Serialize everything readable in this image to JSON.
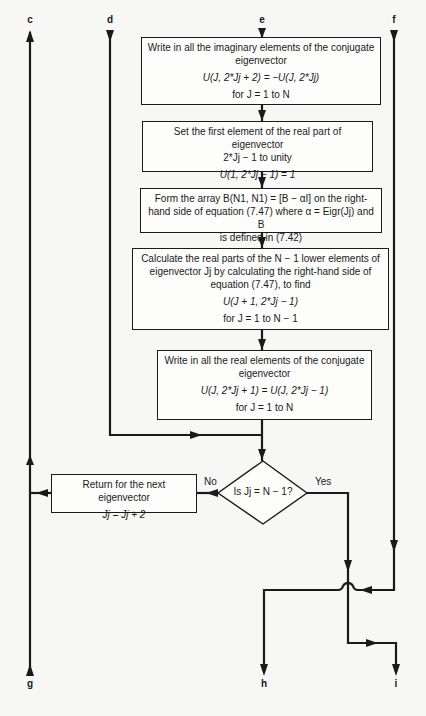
{
  "connectors": {
    "c": "c",
    "d": "d",
    "e": "e",
    "f": "f",
    "g": "g",
    "h": "h",
    "i": "i"
  },
  "boxes": [
    {
      "id": "write-imaginary",
      "lines": [
        "Write in all the imaginary elements of the conjugate",
        "eigenvector"
      ],
      "equation": "U(J, 2*Jj + 2) = −U(J, 2*Jj)",
      "range": "for J = 1 to N"
    },
    {
      "id": "set-first-element",
      "lines": [
        "Set the first element of the real part of eigenvector",
        "2*Jj − 1 to unity"
      ],
      "equation": "U(1, 2*Jj − 1) = 1"
    },
    {
      "id": "form-array",
      "lines": [
        "Form the array B(N1, N1) = [B − αI] on the right-",
        "hand side of equation (7.47) where α = Eigr(Jj) and B",
        "is defined in (7.42)"
      ]
    },
    {
      "id": "calculate-real-parts",
      "lines": [
        "Calculate the real parts of the N − 1 lower elements of",
        "eigenvector Jj by calculating the right-hand side of",
        "equation (7.47), to find"
      ],
      "equation": "U(J + 1, 2*Jj − 1)",
      "range": "for J = 1 to N − 1"
    },
    {
      "id": "write-real",
      "lines": [
        "Write in all the real elements of the conjugate",
        "eigenvector"
      ],
      "equation": "U(J, 2*Jj + 1) = U(J, 2*Jj − 1)",
      "range": "for J = 1 to N"
    },
    {
      "id": "return-next",
      "lines": [
        "Return for the next eigenvector"
      ],
      "equation": "Jj = Jj + 2"
    }
  ],
  "decision": {
    "question": "Is Jj = N − 1?",
    "no_label": "No",
    "yes_label": "Yes"
  },
  "colors": {
    "line": "#1a1a1a",
    "background": "#f7f7f5"
  }
}
